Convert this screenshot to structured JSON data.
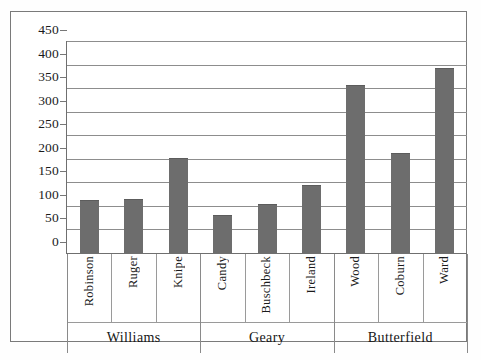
{
  "chart_data": {
    "type": "bar",
    "title": "",
    "subtitle": "",
    "xlabel": "",
    "ylabel": "",
    "ylim": [
      0,
      450
    ],
    "ytick_step": 50,
    "ytick_labels": [
      "450",
      "400",
      "350",
      "300",
      "250",
      "200",
      "150",
      "100",
      "50",
      "0"
    ],
    "ytick_values": [
      450,
      400,
      350,
      300,
      250,
      200,
      150,
      100,
      50,
      0
    ],
    "grid": true,
    "legend": false,
    "legend_position": "none",
    "categories": [
      "Robinson",
      "Ruger",
      "Knipe",
      "Candy",
      "Buschbeck",
      "Ireland",
      "Wood",
      "Coburn",
      "Ward"
    ],
    "values": [
      110,
      112,
      200,
      78,
      102,
      142,
      355,
      210,
      390
    ],
    "groups": [
      {
        "label": "Williams",
        "categories": [
          "Robinson",
          "Ruger",
          "Knipe"
        ],
        "values": [
          110,
          112,
          200
        ]
      },
      {
        "label": "Geary",
        "categories": [
          "Candy",
          "Buschbeck",
          "Ireland"
        ],
        "values": [
          78,
          102,
          142
        ]
      },
      {
        "label": "Butterfield",
        "categories": [
          "Wood",
          "Coburn",
          "Ward"
        ],
        "values": [
          355,
          210,
          390
        ]
      }
    ],
    "bar_color": "#6d6d6d",
    "grid_color": "#8d8d8d",
    "axis_color": "#6f6f6f"
  },
  "bars": [
    {
      "name": "Robinson",
      "value": 110
    },
    {
      "name": "Ruger",
      "value": 112
    },
    {
      "name": "Knipe",
      "value": 200
    },
    {
      "name": "Candy",
      "value": 78
    },
    {
      "name": "Buschbeck",
      "value": 102
    },
    {
      "name": "Ireland",
      "value": 142
    },
    {
      "name": "Wood",
      "value": 355
    },
    {
      "name": "Coburn",
      "value": 210
    },
    {
      "name": "Ward",
      "value": 390
    }
  ],
  "groups": [
    {
      "label": "Williams"
    },
    {
      "label": "Geary"
    },
    {
      "label": "Butterfield"
    }
  ],
  "yticks": [
    {
      "label": "450"
    },
    {
      "label": "400"
    },
    {
      "label": "350"
    },
    {
      "label": "300"
    },
    {
      "label": "250"
    },
    {
      "label": "200"
    },
    {
      "label": "150"
    },
    {
      "label": "100"
    },
    {
      "label": "50"
    },
    {
      "label": "0"
    }
  ]
}
